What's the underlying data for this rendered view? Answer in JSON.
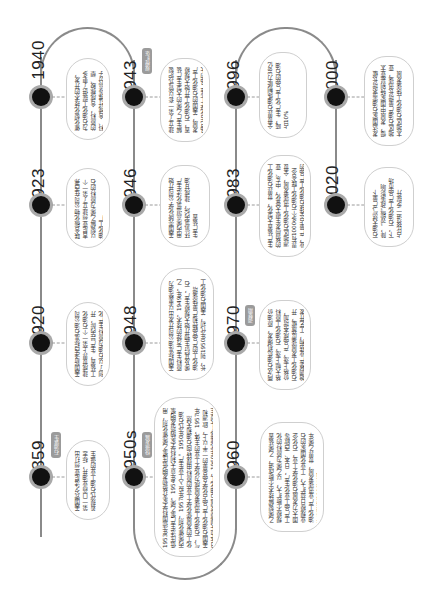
{
  "timeline": {
    "events": [
      {
        "id": "1859",
        "year": "1859",
        "badge": "石油诞生",
        "text": "美国宾夕法尼亚州打出第一口商业油井，标志着现代石油工业的诞生"
      },
      {
        "id": "1920",
        "year": "1920",
        "text": "美国新泽西标准石油公司建成世界上第一个石油化工装置，生产异丙醇，开创了以石油为原料生产化工产品的先河，是石油化工发展的开端"
      },
      {
        "id": "1923",
        "year": "1923",
        "text": "联合碳化物公司在西弗吉尼亚州建立了第一个以裂解乙烯为原料的石油化工厂"
      },
      {
        "id": "1940",
        "year": "1940",
        "text": "催化裂化技术的开发，为石油化工提供了更多的原料，合成橡胶、塑料、合成纤维等高分子材料开始工业化生产，投入市场"
      },
      {
        "id": "1943",
        "year": "1943",
        "badge": "规模扩张",
        "text": "建立了第一套以管式炉裂解生产乙烯的大型生产装置，石油化工开始大规模发展，美国的石油化工产品已占化学工业产品的大部分，成为重要的支柱产业之一"
      },
      {
        "id": "1946",
        "year": "1946",
        "text": "美国壳牌化学公司开始用丙烯高温氯化法生产环氧氯丙烷，建成甘油生产装置"
      },
      {
        "id": "1948",
        "year": "1948",
        "text": "美国标准油公司开发出以重整油为原料生产芳烃的技术，1949年，乙烯及其衍生物开始大规模生产，石油化工的产品品种和产量快速增长，到1950年代初，美国石油化工产品产量占化学工业产品总量的50%以上，石油化工产品占有机化工产品的80%以上"
      },
      {
        "id": "1950s",
        "year": "1950s",
        "badge": "快速发展",
        "text": "1953年德国科学家齐格勒发明低压聚乙烯催化剂，用低压法生产聚乙烯，1954年意大利科学家纳塔发明聚丙烯催化剂，1957年投入工业生产。1950年代石油化工的发展使化学工业的原料由煤转向石油和天然气，石油化工迅速发展成为化学工业的主体，1957年美国石油化工产品占化学品总量的一半以上，欧洲和日本也大规模发展石油化工，1960年代建成了大型生产装置"
      },
      {
        "id": "1960",
        "year": "1960",
        "text": "乙烯裂解技术不断改进，乙烯装置规模不断扩大，以乙烯为原料的化工产品工业化生产，日本、西欧等国大力发展石油化学工业，石化企业规模日益扩大，工业化国家的石油化工产业迅速发展，世界乙烯年产量突破1000万吨"
      },
      {
        "id": "1970",
        "year": "1970",
        "badge": "调整期",
        "text": "两次石油危机爆发，原油价格大幅上涨，石油化工原料价格上涨，产品成本增加，石油化工发展速度放缓，开始调整产业结构，工艺开发和节能"
      },
      {
        "id": "1983",
        "year": "1983",
        "text": "生产装置大型化，世界石油化工的格局发生很大变化，中东、亚洲地区石油化工迅速发展，全世界有1000多个石油化工联合企业，产量占全球石油化工产品的40%，用于石油化工的天然气达到约10%"
      },
      {
        "id": "1996",
        "year": "1996",
        "text": "全世界石油炼制能力38亿吨，生产化工产品的石油占10%"
      },
      {
        "id": "2000",
        "year": "2000",
        "text": "发达国家石油需求增长缓慢，发展中国家特别是亚太地区石油产量增长迅速，亚太地区石油化工快速发展"
      },
      {
        "id": "2020",
        "year": "2020",
        "text": "石油天然气产量下降，“双碳”政策影响下，石油化工产品市场占比将进一步提升"
      }
    ]
  },
  "colors": {
    "line": "#8a8a8a",
    "dot": "#111111",
    "dot_ring": "#a9a9a9",
    "card_border": "#cfcfcf",
    "badge": "#9b9b9b"
  }
}
